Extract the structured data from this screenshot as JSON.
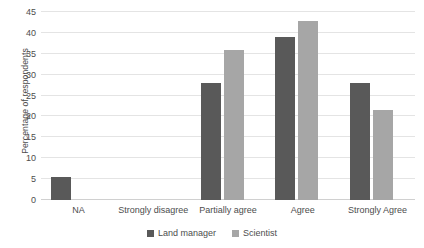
{
  "chart_data": {
    "type": "bar",
    "title": "",
    "xlabel": "",
    "ylabel": "Percentage of respondents",
    "categories": [
      "NA",
      "Strongly disagree",
      "Partially agree",
      "Agree",
      "Strongly Agree"
    ],
    "series": [
      {
        "name": "Land manager",
        "color": "#595959",
        "values": [
          5.6,
          0,
          27.9,
          39.0,
          27.9
        ]
      },
      {
        "name": "Scientist",
        "color": "#a6a6a6",
        "values": [
          0,
          0,
          35.8,
          42.8,
          21.5
        ]
      }
    ],
    "ylim": [
      0,
      45
    ],
    "ytick_step": 5,
    "yticks": [
      0,
      5,
      10,
      15,
      20,
      25,
      30,
      35,
      40,
      45
    ],
    "ytick_labels": [
      "0",
      "5",
      "10",
      "15",
      "20",
      "25",
      "30",
      "35",
      "40",
      "45"
    ],
    "grid": true,
    "grid_axis": "y",
    "grid_color": "#e4e4e4",
    "legend_position": "bottom-center",
    "background": "#ffffff",
    "text_color": "#4d4d4d"
  },
  "legend": {
    "items": [
      {
        "label": "Land manager",
        "color": "#595959",
        "marker": "square-swatch-icon"
      },
      {
        "label": "Scientist",
        "color": "#a6a6a6",
        "marker": "square-swatch-icon"
      }
    ]
  }
}
